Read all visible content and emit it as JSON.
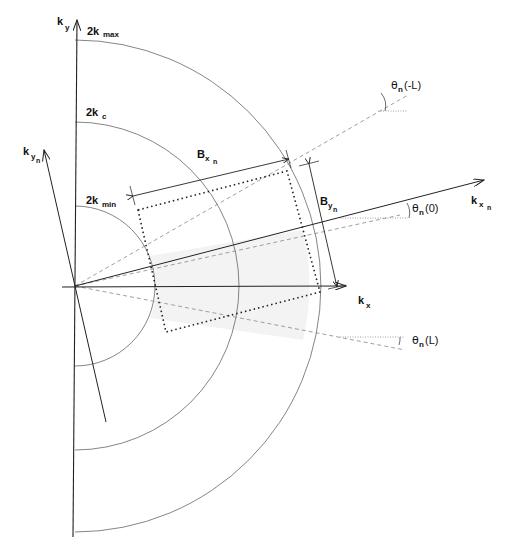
{
  "diagram": {
    "type": "k-space sampling geometry",
    "colors": {
      "axis": "#222222",
      "arc": "#555555",
      "dashed": "#888888",
      "dotted_rect": "#222222",
      "shaded_region": "#f2f2f2",
      "text": "#111111"
    },
    "axes": {
      "kx": {
        "main": "k",
        "sub": "x"
      },
      "ky": {
        "main": "k",
        "sub": "y"
      },
      "kxn": {
        "main": "k",
        "sub": "x",
        "subsub": "n"
      },
      "kyn": {
        "main": "k",
        "sub": "y",
        "subsub": "n"
      }
    },
    "arcs": [
      {
        "name": "2k_max",
        "main": "2k",
        "sub": "max"
      },
      {
        "name": "2k_c",
        "main": "2k",
        "sub": "c"
      },
      {
        "name": "2k_min",
        "main": "2k",
        "sub": "min"
      }
    ],
    "dimensions": {
      "bxn": {
        "main": "B",
        "sub": "x",
        "subsub": "n"
      },
      "byn": {
        "main": "B",
        "sub": "y",
        "subsub": "n"
      }
    },
    "angles": {
      "theta_neg_L": {
        "symbol": "θ",
        "sub": "n",
        "arg": "(-L)"
      },
      "theta_0": {
        "symbol": "θ",
        "sub": "n",
        "arg": "(0)"
      },
      "theta_L": {
        "symbol": "θ",
        "sub": "n",
        "arg": "(L)"
      }
    }
  }
}
